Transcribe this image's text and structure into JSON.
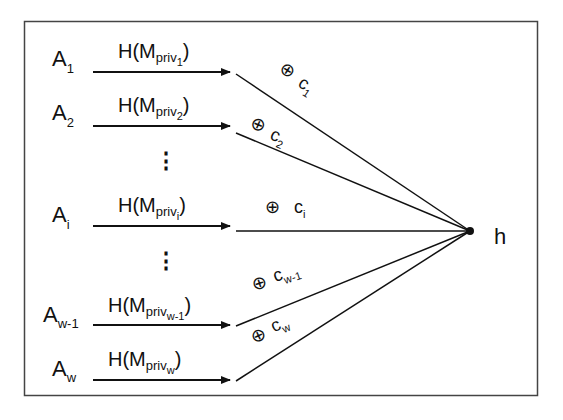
{
  "diagram": {
    "colors": {
      "stroke": "#111111",
      "frame": "#444444",
      "background": "#ffffff"
    },
    "output_node": {
      "label": "h"
    },
    "xor_symbol": "⊕",
    "ellipsis_glyph": "⋮",
    "rows": [
      {
        "id": "1",
        "sender": "A",
        "sender_sub": "1",
        "hash_prefix": "H(M",
        "hash_priv": "priv",
        "hash_sub": "1",
        "hash_suffix": ")",
        "key": "c",
        "key_sub": "1"
      },
      {
        "id": "2",
        "sender": "A",
        "sender_sub": "2",
        "hash_prefix": "H(M",
        "hash_priv": "priv",
        "hash_sub": "2",
        "hash_suffix": ")",
        "key": "c",
        "key_sub": "2"
      },
      {
        "id": "i",
        "sender": "A",
        "sender_sub": "i",
        "hash_prefix": "H(M",
        "hash_priv": "priv",
        "hash_sub": "i",
        "hash_suffix": ")",
        "key": "c",
        "key_sub": "i"
      },
      {
        "id": "w-1",
        "sender": "A",
        "sender_sub": "w-1",
        "hash_prefix": "H(M",
        "hash_priv": "priv",
        "hash_sub": "w-1",
        "hash_suffix": ")",
        "key": "c",
        "key_sub": "w-1"
      },
      {
        "id": "w",
        "sender": "A",
        "sender_sub": "w",
        "hash_prefix": "H(M",
        "hash_priv": "priv",
        "hash_sub": "w",
        "hash_suffix": ")",
        "key": "c",
        "key_sub": "w"
      }
    ]
  }
}
